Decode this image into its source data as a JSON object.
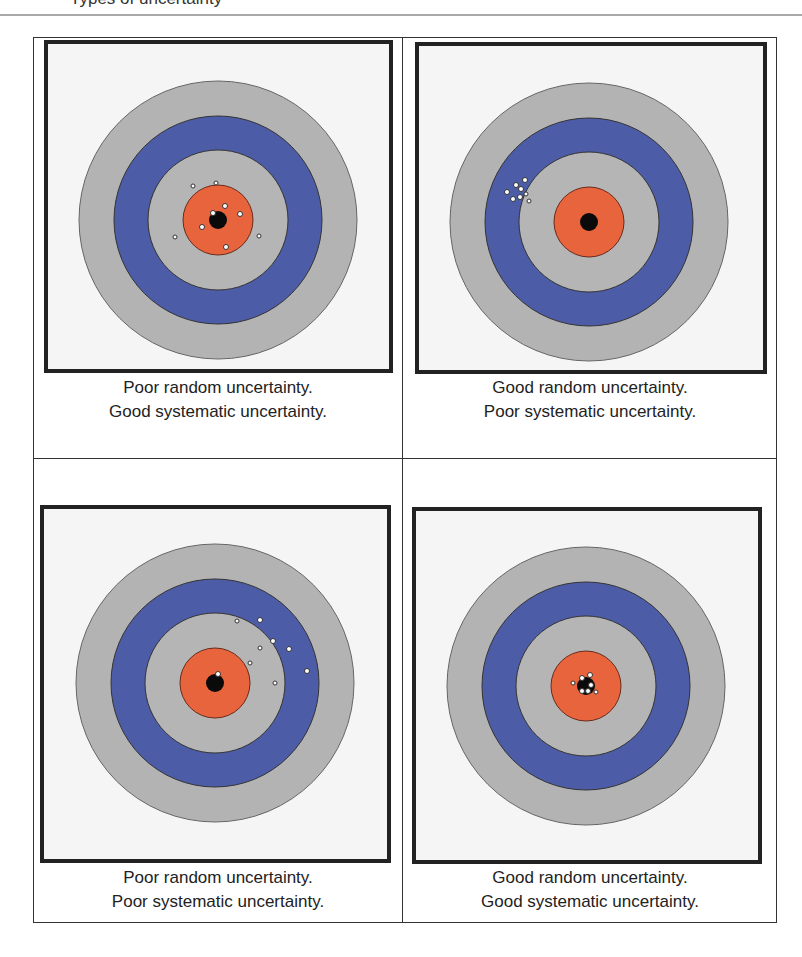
{
  "header": {
    "partial_text": "Types of uncertainty"
  },
  "colors": {
    "outer_ring": "#b3b3b3",
    "blue_ring": "#4d5ca6",
    "inner_ring": "#b5b5b5",
    "orange_ring": "#e8643c",
    "bullseye": "#0a0a0a",
    "frame": "#222222",
    "frame_bg": "#f4f5f4"
  },
  "panels": [
    {
      "id": "top-left",
      "caption_line1": "Poor random uncertainty.",
      "caption_line2": "Good systematic uncertainty.",
      "random": "Poor",
      "systematic": "Good"
    },
    {
      "id": "top-right",
      "caption_line1": "Good random uncertainty.",
      "caption_line2": "Poor systematic uncertainty.",
      "random": "Good",
      "systematic": "Poor"
    },
    {
      "id": "bottom-left",
      "caption_line1": "Poor random uncertainty.",
      "caption_line2": "Poor systematic uncertainty.",
      "random": "Poor",
      "systematic": "Poor"
    },
    {
      "id": "bottom-right",
      "caption_line1": "Good random uncertainty.",
      "caption_line2": "Good systematic uncertainty.",
      "random": "Good",
      "systematic": "Good"
    }
  ]
}
